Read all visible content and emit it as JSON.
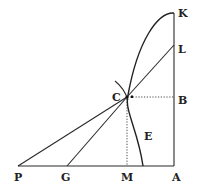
{
  "diagram": {
    "type": "geometric-construction",
    "points": {
      "K": {
        "label": "K",
        "x": 174,
        "y": 13
      },
      "L": {
        "label": "L",
        "x": 174,
        "y": 45
      },
      "B": {
        "label": "B",
        "x": 174,
        "y": 97
      },
      "A": {
        "label": "A",
        "x": 174,
        "y": 166
      },
      "C": {
        "label": "C",
        "x": 127,
        "y": 97
      },
      "M": {
        "label": "M",
        "x": 127,
        "y": 166
      },
      "G": {
        "label": "G",
        "x": 67,
        "y": 166
      },
      "P": {
        "label": "P",
        "x": 18,
        "y": 166
      },
      "E": {
        "label": "E"
      }
    },
    "segments": [
      {
        "from": "P",
        "to": "A",
        "style": "solid"
      },
      {
        "from": "A",
        "to": "K",
        "style": "solid"
      },
      {
        "from": "P",
        "to": "C",
        "style": "solid"
      },
      {
        "from": "G",
        "to": "C",
        "style": "solid"
      },
      {
        "from": "C",
        "to": "L",
        "style": "solid"
      },
      {
        "from": "C",
        "to": "B",
        "style": "dotted"
      },
      {
        "from": "C",
        "to": "M",
        "style": "dotted"
      }
    ],
    "curves": [
      {
        "name": "curve-KCE",
        "description": "curve from K through C down to base line",
        "style": "solid"
      },
      {
        "name": "small-arc-at-C",
        "description": "short arc crossing at C",
        "style": "solid"
      }
    ]
  }
}
